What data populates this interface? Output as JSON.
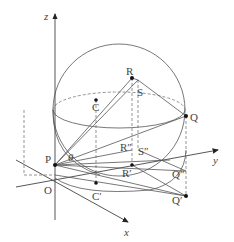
{
  "diagram": {
    "axes": {
      "x_label": "x",
      "y_label": "y",
      "z_label": "z",
      "origin_label": "O"
    },
    "angle_label": "θ",
    "points": {
      "P": "P",
      "Q": "Q",
      "R": "R",
      "S": "S",
      "C": "C",
      "C_prime": "C′",
      "R_prime": "R′",
      "Q_prime": "Q′",
      "R_dprime": "R″",
      "S_dprime": "S″",
      "Q_dprime": "Q″"
    }
  }
}
